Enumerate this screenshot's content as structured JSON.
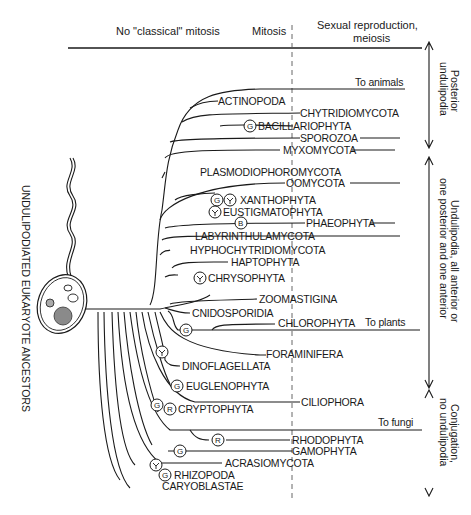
{
  "header": {
    "col1": "No \"classical\" mitosis",
    "col2": "Mitosis",
    "col3_line1": "Sexual reproduction,",
    "col3_line2": "meiosis"
  },
  "left_label": "UNDULIPODIATED EUKARYOTE ANCESTORS",
  "side_labels": {
    "posterior_1": "Posterior",
    "posterior_2": "undulipodia",
    "anterior_1": "Undulipodia, all anterior or",
    "anterior_2": "one posterior and one anterior",
    "conj_1": "Conjugation,",
    "conj_2": "no undulipodia"
  },
  "destinations": {
    "animals": "To animals",
    "plants": "To plants",
    "fungi": "To fungi"
  },
  "taxa": [
    "ACTINOPODA",
    "CHYTRIDIOMYCOTA",
    "BACILLARIOPHYTA",
    "SPOROZOA",
    "MYXOMYCOTA",
    "PLASMODIOPHOROMYCOTA",
    "OOMYCOTA",
    "XANTHOPHYTA",
    "EUSTIGMATOPHYTA",
    "PHAEOPHYTA",
    "LABYRINTHULAMYCOTA",
    "HYPHOCHYTRIDIOMYCOTA",
    "HAPTOPHYTA",
    "CHRYSOPHYTA",
    "ZOOMASTIGINA",
    "CNIDOSPORIDIA",
    "CHLOROPHYTA",
    "FORAMINIFERA",
    "DINOFLAGELLATA",
    "EUGLENOPHYTA",
    "CILIOPHORA",
    "CRYPTOPHYTA",
    "RHODOPHYTA",
    "GAMOPHYTA",
    "ACRASIOMYCOTA",
    "RHIZOPODA",
    "CARYOBLASTAE"
  ],
  "markers": {
    "G": "G",
    "B": "B",
    "R": "R"
  },
  "colors": {
    "ink": "#1a1a1a",
    "background": "#ffffff"
  }
}
